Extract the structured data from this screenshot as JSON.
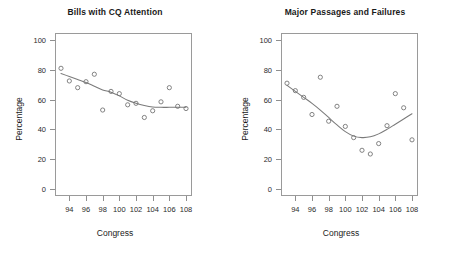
{
  "figure": {
    "background": "#ffffff",
    "point_color": "#6e6e6e",
    "line_color": "#7a7a7a",
    "axis_color": "#9a9a9a"
  },
  "panels": [
    {
      "key": "bills_cq_attention",
      "title": "Bills with CQ Attention",
      "xlabel": "Congress",
      "ylabel": "Percentage"
    },
    {
      "key": "major_passages_failures",
      "title": "Major Passages and Failures",
      "xlabel": "Congress",
      "ylabel": "Percentage"
    }
  ],
  "chart_data": [
    {
      "type": "scatter",
      "title": "Bills with CQ Attention",
      "xlabel": "Congress",
      "ylabel": "Percentage",
      "xlim": [
        92.4,
        108.6
      ],
      "ylim": [
        -4,
        104
      ],
      "xticks": [
        94,
        96,
        98,
        100,
        102,
        104,
        106,
        108
      ],
      "yticks": [
        0,
        20,
        40,
        60,
        80,
        100
      ],
      "grid": false,
      "legend": "none",
      "x": [
        93,
        94,
        95,
        96,
        97,
        98,
        99,
        100,
        101,
        102,
        103,
        104,
        105,
        106,
        107,
        108
      ],
      "values": [
        81,
        72.5,
        68,
        72,
        77,
        53,
        65.5,
        64,
        56.5,
        57.5,
        48,
        52.5,
        58.5,
        68,
        55.5,
        54
      ],
      "series": [
        {
          "name": "Percentage of bills with CQ attention",
          "marker": "open-circle",
          "values": [
            81,
            72.5,
            68,
            72,
            77,
            53,
            65.5,
            64,
            56.5,
            57.5,
            48,
            52.5,
            58.5,
            68,
            55.5,
            54
          ]
        },
        {
          "name": "LOESS smooth",
          "type": "line",
          "x": [
            93,
            94,
            95,
            96,
            97,
            98,
            99,
            100,
            101,
            102,
            103,
            104,
            105,
            106,
            107,
            108
          ],
          "values": [
            77.5,
            75.5,
            73.5,
            71.5,
            69,
            66.5,
            65,
            62.5,
            59.5,
            57.5,
            56,
            55,
            54.8,
            54.8,
            54.8,
            54.8
          ]
        }
      ]
    },
    {
      "type": "scatter",
      "title": "Major Passages and Failures",
      "xlabel": "Congress",
      "ylabel": "Percentage",
      "xlim": [
        92.4,
        108.6
      ],
      "ylim": [
        -4,
        104
      ],
      "xticks": [
        94,
        96,
        98,
        100,
        102,
        104,
        106,
        108
      ],
      "yticks": [
        0,
        20,
        40,
        60,
        80,
        100
      ],
      "grid": false,
      "legend": "none",
      "x": [
        93,
        94,
        95,
        96,
        97,
        98,
        99,
        100,
        101,
        102,
        103,
        104,
        105,
        106,
        107,
        108
      ],
      "values": [
        71,
        66,
        61.5,
        50,
        75,
        45.5,
        55.5,
        42,
        34.5,
        26,
        23.5,
        30.5,
        42.5,
        64,
        54.5,
        33
      ],
      "series": [
        {
          "name": "Percentage of major passages and failures",
          "marker": "open-circle",
          "values": [
            71,
            66,
            61.5,
            50,
            75,
            45.5,
            55.5,
            42,
            34.5,
            26,
            23.5,
            30.5,
            42.5,
            64,
            54.5,
            33
          ]
        },
        {
          "name": "LOESS smooth",
          "type": "line",
          "x": [
            93,
            94,
            95,
            96,
            97,
            98,
            99,
            100,
            101,
            102,
            103,
            104,
            105,
            106,
            107,
            108
          ],
          "values": [
            69.5,
            65.5,
            61.5,
            57.5,
            53,
            48,
            43,
            38.5,
            35.5,
            34.5,
            35,
            37,
            40,
            43.5,
            47,
            50.5
          ]
        }
      ]
    }
  ]
}
